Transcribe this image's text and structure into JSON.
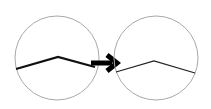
{
  "diagram": {
    "colors": {
      "background": "#ffffff",
      "circle_stroke": "#a8a8a8",
      "line_stroke": "#111111",
      "arrow": "#000000"
    },
    "left_circle": {
      "cx": 57,
      "cy": 58,
      "r": 42,
      "polyline": "16,69 58,57 95,67",
      "line_width": 2.2
    },
    "arrow": {
      "x1": 91,
      "y": 63,
      "x2": 120,
      "icon": "right-arrow"
    },
    "right_circle": {
      "cx": 156,
      "cy": 58,
      "r": 42,
      "polyline": "116,72 154,61 195,73",
      "line_width": 1.3
    }
  }
}
